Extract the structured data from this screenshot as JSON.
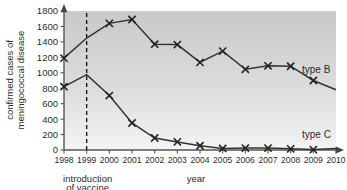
{
  "chart_data": {
    "type": "line",
    "title": "",
    "xlabel": "year",
    "ylabel": "confirmed cases of meningococcal disease",
    "x": [
      1998,
      1999,
      2000,
      2001,
      2002,
      2003,
      2004,
      2005,
      2006,
      2007,
      2008,
      2009,
      2010
    ],
    "xlim": [
      1998,
      2010
    ],
    "ylim": [
      0,
      1800
    ],
    "yticks": [
      0,
      200,
      400,
      600,
      800,
      1000,
      1200,
      1400,
      1600,
      1800
    ],
    "xticks": [
      "1998",
      "1999",
      "2000",
      "2001",
      "2002",
      "2003",
      "2004",
      "2005",
      "2006",
      "2007",
      "2008",
      "2009",
      "2010"
    ],
    "grid": false,
    "legend_position": "inline-right",
    "marker": "x",
    "series": [
      {
        "name": "type B",
        "label": "type B",
        "color": "#333333",
        "values": [
          1190,
          1450,
          1640,
          1690,
          1370,
          1365,
          1135,
          1280,
          1045,
          1090,
          1085,
          900,
          780
        ],
        "markers": [
          true,
          false,
          true,
          true,
          true,
          true,
          true,
          true,
          true,
          true,
          true,
          true,
          false
        ]
      },
      {
        "name": "type C",
        "label": "type C",
        "color": "#333333",
        "values": [
          820,
          975,
          705,
          350,
          155,
          105,
          55,
          20,
          25,
          25,
          15,
          5,
          20
        ],
        "markers": [
          true,
          false,
          true,
          true,
          true,
          true,
          true,
          true,
          true,
          true,
          true,
          true,
          false
        ]
      }
    ],
    "annotations": [
      {
        "name": "vaccine-introduction-line",
        "type": "vline",
        "x": 1999,
        "style": "dashed",
        "label_line_1": "introduction",
        "label_line_2": "of vaccine"
      }
    ]
  },
  "axes": {
    "y_title": "confirmed cases of meningococcal disease",
    "x_title": "year",
    "y_ticks": [
      "1800",
      "1600",
      "1400",
      "1200",
      "1000",
      "800",
      "600",
      "400",
      "200",
      "0"
    ],
    "x_ticks": [
      "1998",
      "1999",
      "2000",
      "2001",
      "2002",
      "2003",
      "2004",
      "2005",
      "2006",
      "2007",
      "2008",
      "2009",
      "2010"
    ]
  },
  "labels": {
    "type_b": "type B",
    "type_c": "type C",
    "annotation_line_1": "introduction",
    "annotation_line_2": "of vaccine"
  },
  "colors": {
    "line": "#333333",
    "axis": "#555555",
    "plot_bg_top": "#cfcfcf",
    "plot_bg_bottom": "#f2f2f2",
    "text": "#2b2b2b"
  }
}
